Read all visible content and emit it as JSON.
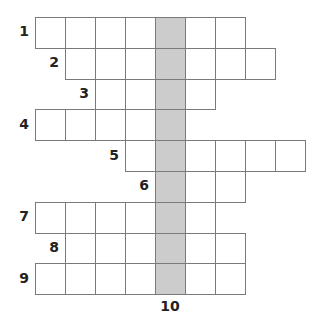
{
  "puzzle": {
    "top_cut_text": "— —",
    "highlight_color": "#cccccc",
    "border_color": "#7a7a7a",
    "grid_origin": {
      "x": 35,
      "y": 17
    },
    "cell_width": 30,
    "row_height": 30.8,
    "highlight_column": 4,
    "vertical_clue": {
      "number": "10",
      "column": 4
    },
    "rows": [
      {
        "number": "1",
        "start_col": 0,
        "length": 7
      },
      {
        "number": "2",
        "start_col": 1,
        "length": 7
      },
      {
        "number": "3",
        "start_col": 2,
        "length": 4
      },
      {
        "number": "4",
        "start_col": 0,
        "length": 5
      },
      {
        "number": "5",
        "start_col": 3,
        "length": 6
      },
      {
        "number": "6",
        "start_col": 4,
        "length": 3
      },
      {
        "number": "7",
        "start_col": 0,
        "length": 6
      },
      {
        "number": "8",
        "start_col": 1,
        "length": 6
      },
      {
        "number": "9",
        "start_col": 0,
        "length": 7
      }
    ]
  }
}
